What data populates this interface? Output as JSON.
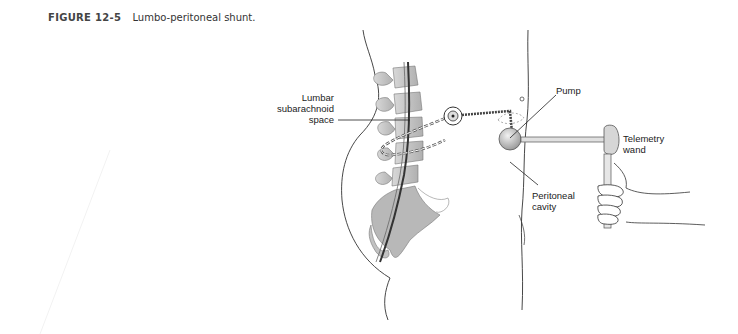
{
  "figure": {
    "number": "FIGURE 12-5",
    "title": "Lumbo-peritoneal shunt."
  },
  "labels": {
    "lumbar_line1": "Lumbar",
    "lumbar_line2": "subarachnoid",
    "lumbar_line3": "space",
    "pump": "Pump",
    "telemetry_line1": "Telemetry",
    "telemetry_line2": "wand",
    "peritoneal_line1": "Peritoneal",
    "peritoneal_line2": "cavity"
  },
  "colors": {
    "bone": "#c8c8c8",
    "bone_dark": "#9a9a9a",
    "line": "#222222",
    "pump": "#bdbdbd"
  }
}
